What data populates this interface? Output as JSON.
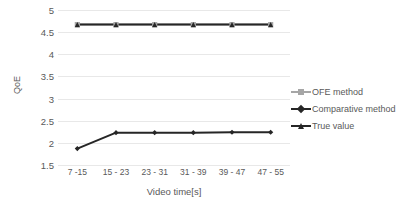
{
  "chart_data": {
    "type": "line",
    "title": "",
    "xlabel": "Video time[s]",
    "ylabel": "QoE",
    "categories": [
      "7 -15",
      "15 - 23",
      "23 - 31",
      "31 - 39",
      "39 - 47",
      "47 - 55"
    ],
    "series": [
      {
        "name": "OFE method",
        "color": "#a6a6a6",
        "marker": "square",
        "values": [
          4.67,
          4.67,
          4.67,
          4.67,
          4.67,
          4.67
        ]
      },
      {
        "name": "Comparative method",
        "color": "#262626",
        "marker": "diamond",
        "values": [
          1.87,
          2.23,
          2.23,
          2.23,
          2.24,
          2.24
        ]
      },
      {
        "name": "True value",
        "color": "#262626",
        "marker": "triangle",
        "values": [
          4.67,
          4.67,
          4.67,
          4.67,
          4.67,
          4.67
        ]
      }
    ],
    "ylim": [
      1.5,
      5.0
    ],
    "yticks": [
      1.5,
      2,
      2.5,
      3,
      3.5,
      4,
      4.5,
      5
    ],
    "ytick_labels": [
      "1.5",
      "2",
      "2.5",
      "3",
      "3.5",
      "4",
      "4.5",
      "5"
    ],
    "grid": true,
    "grid_color": "#e8e8e8",
    "legend_position": "right",
    "background": "#ffffff",
    "text_color": "#595959"
  }
}
